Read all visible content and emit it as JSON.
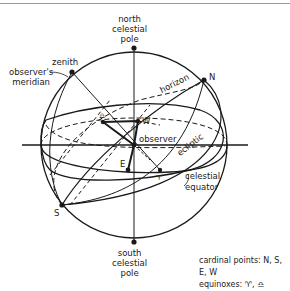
{
  "diagram": {
    "type": "celestial-sphere",
    "labels": {
      "north_pole": [
        "north",
        "celestial",
        "pole"
      ],
      "south_pole": [
        "south",
        "celestial",
        "pole"
      ],
      "zenith": "zenith",
      "meridian": [
        "observer's",
        "meridian"
      ],
      "horizon": "horizon",
      "ecliptic": "ecliptic",
      "equator": [
        "celestial",
        "equator"
      ],
      "observer": "observer",
      "N": "N",
      "S": "S",
      "E": "E",
      "W": "W",
      "vernal_equinox": "♈",
      "autumnal_equinox": "♎"
    },
    "legend": {
      "cardinal": "cardinal points: N, S, E, W",
      "equinoxes": "equinoxes: ♈, ♎"
    },
    "colors": {
      "line": "#1a1a1a",
      "background": "#ffffff",
      "rule": "#9a9a9a"
    }
  }
}
